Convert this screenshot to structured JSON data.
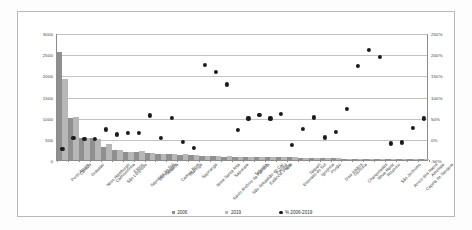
{
  "chart_data": {
    "type": "bar",
    "title": "",
    "subtitle": "",
    "xlabel": "",
    "ylabel": "",
    "y2label": "",
    "grid": true,
    "legend_position": "bottom",
    "ylim": [
      0,
      3000
    ],
    "yticks": [
      "0",
      "500",
      "1000",
      "1500",
      "2000",
      "2500",
      "3000"
    ],
    "y2lim": [
      -50,
      250
    ],
    "y2ticks": [
      "-50%",
      "0%",
      "50%",
      "100%",
      "150%",
      "200%",
      "250%"
    ],
    "categories": [
      "Porto Alegre",
      "Canoas",
      "Gravataí",
      "Novo Hamburgo",
      "Cachoeirinha",
      "São Leopoldo",
      "Esteio",
      "Sapucaia do Sul",
      "Montenegro",
      "Araricá",
      "Campo Bom",
      "Maringá",
      "Sapiranga",
      "Nova Santa Rita",
      "Santo Antônio da Patrulha",
      "Sapucaia",
      "São Sebastião do Caí",
      "Taquara",
      "Estância Velha",
      "Parobé",
      "Ivoti",
      "Eldorado do Sul",
      "Taquari",
      "Igrejinha",
      "Portão",
      "Dois Irmãos",
      "Glorinha",
      "Charqueadas",
      "Nova Hartz",
      "Riozinho",
      "São Jerônimo",
      "Arroio dos Ratos",
      "Capela de Santana",
      "Ametista"
    ],
    "series": [
      {
        "name": "2006",
        "color": "#8f8f8f",
        "values": [
          2540,
          990,
          530,
          510,
          300,
          230,
          190,
          195,
          165,
          150,
          140,
          130,
          125,
          90,
          85,
          80,
          78,
          75,
          72,
          70,
          68,
          66,
          58,
          50,
          45,
          40,
          32,
          28,
          24,
          20,
          16,
          12,
          10,
          8
        ]
      },
      {
        "name": "2019",
        "color": "#b7b7b7",
        "values": [
          1910,
          1010,
          530,
          505,
          375,
          235,
          200,
          205,
          170,
          148,
          138,
          132,
          118,
          95,
          88,
          84,
          80,
          78,
          74,
          72,
          70,
          64,
          56,
          48,
          42,
          36,
          30,
          26,
          22,
          18,
          14,
          10,
          8,
          6
        ]
      }
    ],
    "scatter_series": {
      "name": "% 2006-2019",
      "color": "#1b1b1b",
      "values": [
        -25,
        1,
        0,
        -1,
        22,
        10,
        14,
        13,
        55,
        1,
        49,
        -8,
        -22,
        175,
        158,
        128,
        21,
        48,
        56,
        48,
        58,
        -14,
        24,
        50,
        3,
        16,
        70,
        172,
        210,
        193,
        -11,
        -9,
        25,
        48,
        18
      ]
    }
  },
  "legend": {
    "items": [
      {
        "label": "2006",
        "marker": "square",
        "color": "#8f8f8f"
      },
      {
        "label": "2019",
        "marker": "square",
        "color": "#b7b7b7"
      },
      {
        "label": "% 2006-2019",
        "marker": "circle",
        "color": "#1b1b1b"
      }
    ]
  }
}
